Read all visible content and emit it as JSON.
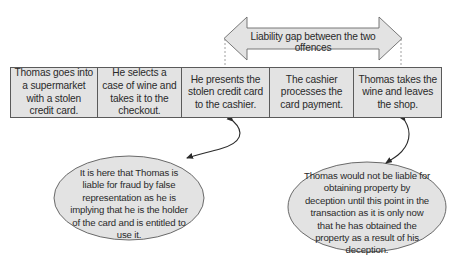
{
  "diagram": {
    "gap_arrow": {
      "label": "Liability gap between the two offences",
      "fill": "#e3e3e3",
      "stroke": "#6a6a6a"
    },
    "steps": [
      {
        "text": "Thomas goes into a supermarket with a stolen credit card."
      },
      {
        "text": "He selects a case of wine and takes it to the checkout."
      },
      {
        "text": "He presents the stolen credit card to the cashier."
      },
      {
        "text": "The cashier processes the card payment."
      },
      {
        "text": "Thomas takes the wine and leaves the shop."
      }
    ],
    "callouts": [
      {
        "points_to_step": 3,
        "text": "It is here that Thomas is liable for fraud by false representation as he is implying that he is the holder of the card and is entitled to use it."
      },
      {
        "points_to_step": 5,
        "text": "Thomas would not be liable for obtaining property by deception until this point in the transaction as it is only now that he has obtained the property as a result of his deception."
      }
    ],
    "colors": {
      "box_fill": "#e3e3e3",
      "border": "#5a5a5a",
      "text": "#2a2a2a",
      "connector": "#2a2a2a"
    }
  }
}
